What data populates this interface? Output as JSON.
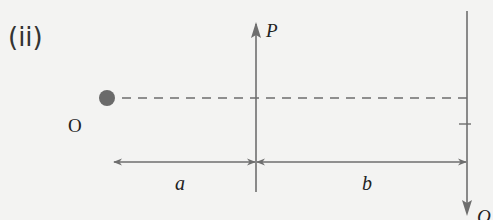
{
  "figure": {
    "part_label": "(ii)",
    "pivot_label": "O",
    "force_p_label": "P",
    "force_q_label": "Q",
    "distance_a_label": "a",
    "distance_b_label": "b"
  },
  "colors": {
    "background": "#f3f3f2",
    "line": "#6e6e6e",
    "pivot_dot": "#6a6a6a",
    "text": "#222222"
  }
}
